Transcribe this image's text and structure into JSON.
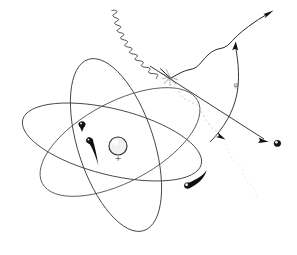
{
  "figure": {
    "background_color": "#ffffff",
    "ink_color": "#1a1a1a",
    "width": 297,
    "height": 255
  },
  "nucleus": {
    "label": "nucleus",
    "charge_symbol": "+",
    "center_x": 118,
    "center_y": 146,
    "radius": 9
  },
  "orbits": [
    {
      "name": "orbit-upright",
      "cx": 116,
      "cy": 145,
      "rx": 38,
      "ry": 90,
      "rotation_deg": -18
    },
    {
      "name": "orbit-flat",
      "cx": 112,
      "cy": 142,
      "rx": 92,
      "ry": 33,
      "rotation_deg": 14
    },
    {
      "name": "orbit-diagonal",
      "cx": 120,
      "cy": 142,
      "rx": 88,
      "ry": 40,
      "rotation_deg": -28
    }
  ],
  "electrons": [
    {
      "name": "electron-upper-left",
      "x": 82,
      "y": 128,
      "note": "arrowhead on upper-left orbit"
    },
    {
      "name": "electron-inner-left",
      "x": 90,
      "y": 142,
      "note": "tapered motion tail toward lower right"
    },
    {
      "name": "electron-lower",
      "x": 186,
      "y": 186,
      "note": "small sphere with trailing arc"
    },
    {
      "name": "electron-ejected",
      "x": 277,
      "y": 143,
      "note": "ejected electron leaving to the right"
    }
  ],
  "incident_photon": {
    "name": "incident-photon",
    "description": "wavy incoming photon from upper left",
    "start_x": 113,
    "start_y": 14,
    "end_x": 168,
    "end_y": 76,
    "wave_count": 13
  },
  "scattered_photon": {
    "name": "scattered-photon",
    "description": "scattered photon leaving to upper right",
    "start_x": 172,
    "start_y": 78,
    "end_x": 272,
    "end_y": 12
  },
  "ejected_electron_track": {
    "name": "ejected-electron-track",
    "description": "straight track from collision to lower right",
    "start_x": 170,
    "start_y": 78,
    "end_x": 272,
    "end_y": 142
  },
  "recoil_track": {
    "name": "recoil-track",
    "description": "curved recoil line through angle marker",
    "start_x": 236,
    "start_y": 45,
    "end_x": 208,
    "end_y": 140
  },
  "stipple_trail": {
    "name": "stipple-trail",
    "description": "faint stippled trail descending from collision point",
    "start_x": 175,
    "start_y": 82,
    "end_x": 258,
    "end_y": 196
  },
  "angle_marker": {
    "name": "angle-marker",
    "symbol": "φ",
    "x": 236,
    "y": 85
  },
  "collision_point": {
    "name": "collision-point",
    "x": 170,
    "y": 77
  },
  "arrows": [
    {
      "name": "arrow-scattered-photon",
      "x": 272,
      "y": 12,
      "direction": "up-right"
    },
    {
      "name": "arrow-recoil",
      "x": 236,
      "y": 44,
      "direction": "up"
    },
    {
      "name": "arrow-ejected-electron",
      "x": 268,
      "y": 139,
      "direction": "right"
    },
    {
      "name": "arrow-orbit-electron",
      "x": 82,
      "y": 130,
      "direction": "down"
    },
    {
      "name": "arrow-stipple",
      "x": 223,
      "y": 137,
      "direction": "down-right"
    }
  ]
}
